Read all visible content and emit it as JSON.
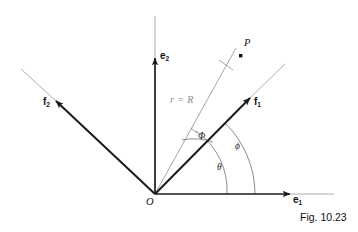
{
  "figure": {
    "caption": "Fig. 10.23",
    "background_color": "#ffffff",
    "axis_color": "#1a1a1a",
    "vector_color": "#1a1a1a",
    "ray_color": "#9a9a9a",
    "arc_color": "#6e6e6e",
    "label_color": "#101010",
    "ray_label_color": "#8c8c8c"
  },
  "axes": [
    {
      "name": "e1",
      "label": "e",
      "subscript": "1",
      "description": "horizontal basis vector pointing right",
      "origin": [
        155,
        194
      ],
      "arrow_tip": [
        290,
        194
      ],
      "extension_end": [
        334,
        194
      ]
    },
    {
      "name": "e2",
      "label": "e",
      "subscript": "2",
      "description": "vertical basis vector pointing up",
      "origin": [
        155,
        194
      ],
      "arrow_tip": [
        155,
        58
      ],
      "extension_end": [
        155,
        16
      ]
    }
  ],
  "vectors": [
    {
      "name": "f1",
      "label": "f",
      "subscript": "1",
      "description": "rotated basis vector in first quadrant",
      "origin": [
        155,
        194
      ],
      "arrow_tip": [
        250,
        98
      ],
      "extension_end": [
        285,
        64
      ]
    },
    {
      "name": "f2",
      "label": "f",
      "subscript": "2",
      "description": "rotated basis vector in second quadrant",
      "origin": [
        155,
        194
      ],
      "arrow_tip": [
        56,
        101
      ],
      "extension_end": [
        21,
        69
      ]
    }
  ],
  "rays": [
    {
      "name": "r-equals-R",
      "label": "r = R",
      "description": "gray radial ray from origin through point P, marked with a perpendicular tick",
      "origin": [
        155,
        194
      ],
      "end": [
        236,
        48
      ],
      "tick_at": [
        226,
        66
      ]
    }
  ],
  "points": [
    {
      "name": "P",
      "label": "P",
      "position": [
        241,
        56
      ],
      "label_position": [
        246,
        41
      ]
    },
    {
      "name": "O",
      "label": "O",
      "position": [
        155,
        194
      ],
      "label_position": [
        148,
        197
      ]
    }
  ],
  "angles": [
    {
      "name": "Phi",
      "label": "Φ",
      "description": "angle between the r = R ray and the f1 vector",
      "label_position": [
        199,
        131
      ],
      "arc_radius": 60
    },
    {
      "name": "phi",
      "label": "ϕ",
      "description": "angle between the f1 vector and the e1 axis",
      "label_position": [
        236,
        141
      ],
      "arc_radius": 100
    },
    {
      "name": "theta",
      "label": "θ",
      "description": "angle between the r = R ray and the e1 axis",
      "label_position": [
        218,
        162
      ],
      "arc_radius": 72
    }
  ]
}
